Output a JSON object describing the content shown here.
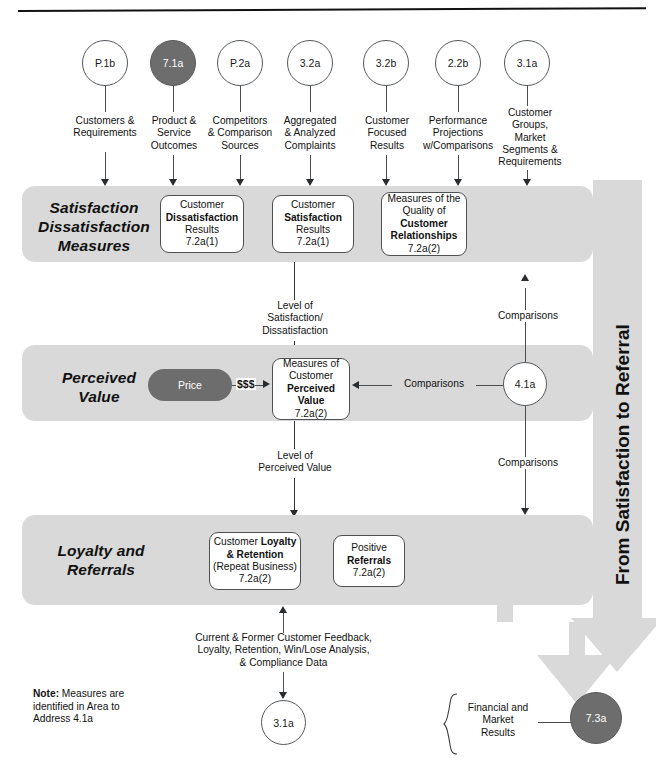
{
  "diagram": {
    "title": "From Satisfaction to Referral",
    "vertical_banner_text": "From Satisfaction to Referral",
    "colors": {
      "band_gray": "#d9d9d9",
      "dark_node": "#6d6d6d",
      "arrow_gray": "#d9d9d9",
      "line": "#4a4e51",
      "text": "#111111"
    }
  },
  "top_nodes": [
    {
      "id": "p1b",
      "code": "P.1b",
      "filled": false,
      "caption": "Customers &\nRequirements"
    },
    {
      "id": "71a",
      "code": "7.1a",
      "filled": true,
      "caption": "Product &\nService\nOutcomes"
    },
    {
      "id": "p2a",
      "code": "P.2a",
      "filled": false,
      "caption": "Competitors\n& Comparison\nSources"
    },
    {
      "id": "32a",
      "code": "3.2a",
      "filled": false,
      "caption": "Aggregated\n& Analyzed\nComplaints"
    },
    {
      "id": "32b",
      "code": "3.2b",
      "filled": false,
      "caption": "Customer\nFocused\nResults"
    },
    {
      "id": "22b",
      "code": "2.2b",
      "filled": false,
      "caption": "Performance\nProjections\nw/Comparisons"
    },
    {
      "id": "31a",
      "code": "3.1a",
      "filled": false,
      "caption": "Customer\nGroups,\nMarket\nSegments &\nRequirements"
    }
  ],
  "bands": [
    {
      "id": "satisfaction",
      "label": "Satisfaction\nDissatisfaction\nMeasures",
      "boxes": [
        {
          "id": "dissat",
          "lines": [
            {
              "t": "Customer",
              "b": false
            },
            {
              "t": "Dissatisfaction",
              "b": true
            },
            {
              "t": "Results",
              "b": false
            },
            {
              "t": "7.2a(1)",
              "b": false
            }
          ]
        },
        {
          "id": "sat",
          "lines": [
            {
              "t": "Customer",
              "b": false
            },
            {
              "t": "Satisfaction",
              "b": true
            },
            {
              "t": "Results",
              "b": false
            },
            {
              "t": "7.2a(1)",
              "b": false
            }
          ]
        },
        {
          "id": "quality",
          "lines": [
            {
              "t": "Measures of the",
              "b": false
            },
            {
              "t": "Quality of",
              "b": false
            },
            {
              "t": "Customer",
              "b": true
            },
            {
              "t": "Relationships",
              "b": true
            },
            {
              "t": "7.2a(2)",
              "b": false
            }
          ]
        }
      ]
    },
    {
      "id": "perceived-value",
      "label": "Perceived\nValue",
      "price_pill": "Price",
      "price_connector": "$$$",
      "boxes": [
        {
          "id": "pv",
          "lines": [
            {
              "t": "Measures of",
              "b": false
            },
            {
              "t": "Customer",
              "b": false
            },
            {
              "t": "Perceived",
              "b": true
            },
            {
              "t": "Value",
              "b": true
            },
            {
              "t": "7.2a(2)",
              "b": false
            }
          ]
        }
      ]
    },
    {
      "id": "loyalty",
      "label": "Loyalty and\nReferrals",
      "boxes": [
        {
          "id": "loyalty-retention",
          "lines": [
            {
              "t": "Customer Loyalty",
              "b": "mixed1"
            },
            {
              "t": "& Retention",
              "b": true
            },
            {
              "t": "(Repeat Business)",
              "b": false
            },
            {
              "t": "7.2a(2)",
              "b": false
            }
          ]
        },
        {
          "id": "referrals",
          "lines": [
            {
              "t": "Positive",
              "b": false
            },
            {
              "t": "Referrals",
              "b": true
            },
            {
              "t": "7.2a(2)",
              "b": false
            }
          ]
        }
      ]
    }
  ],
  "flow_labels": {
    "level_of_satisfaction": "Level of\nSatisfaction/\nDissatisfaction",
    "level_of_perceived_value": "Level of\nPerceived Value",
    "comparisons_top": "Comparisons",
    "comparisons_mid": "Comparisons",
    "comparisons_bottom": "Comparisons",
    "feedback": "Current & Former Customer Feedback,\nLoyalty, Retention, Win/Lose Analysis,\n& Compliance Data"
  },
  "bottom": {
    "note": "Note: Measures are identified in Area to Address 4.1a",
    "note_bold_prefix": "Note:",
    "note_rest": " Measures are\nidentified in Area to\nAddress 4.1a",
    "feedback_node": {
      "code": "3.1a",
      "filled": false
    },
    "results_label": "Financial and\nMarket\nResults",
    "results_node": {
      "code": "7.3a",
      "filled": true
    }
  },
  "side_node": {
    "code": "4.1a",
    "filled": false
  }
}
